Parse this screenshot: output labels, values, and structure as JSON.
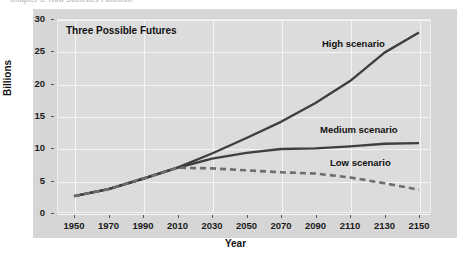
{
  "running_head": "Chapter 3: How Societies Function",
  "chart_data": {
    "type": "line",
    "title": "Three Possible Futures",
    "xlabel": "Year",
    "ylabel": "Billions",
    "xlim": [
      1950,
      2150
    ],
    "ylim": [
      0,
      30
    ],
    "grid": true,
    "legend_position": "inline-annotations",
    "xticks": [
      "1950",
      "1970",
      "1990",
      "2010",
      "2030",
      "2050",
      "2070",
      "2090",
      "2110",
      "2130",
      "2150"
    ],
    "yticks": [
      "0",
      "5",
      "10",
      "15",
      "20",
      "25",
      "30"
    ],
    "x": [
      1950,
      1970,
      1990,
      2010,
      2030,
      2050,
      2070,
      2090,
      2110,
      2130,
      2150
    ],
    "series": [
      {
        "name": "High scenario",
        "style": "solid",
        "color": "#3f3f3f",
        "values": [
          2.6,
          3.7,
          5.3,
          7.0,
          9.2,
          11.6,
          14.1,
          17.0,
          20.4,
          24.8,
          27.9
        ]
      },
      {
        "name": "Medium scenario",
        "style": "solid",
        "color": "#3f3f3f",
        "values": [
          2.6,
          3.7,
          5.3,
          7.0,
          8.4,
          9.3,
          9.9,
          10.0,
          10.3,
          10.7,
          10.8
        ]
      },
      {
        "name": "Low scenario",
        "style": "dashed",
        "color": "#6e6e6e",
        "values": [
          2.6,
          3.7,
          5.3,
          7.0,
          6.9,
          6.6,
          6.3,
          6.1,
          5.5,
          4.6,
          3.6
        ]
      }
    ],
    "annotations": [
      {
        "text": "High scenario",
        "near_x": 2090,
        "near_y": 24.5
      },
      {
        "text": "Medium scenario",
        "near_x": 2085,
        "near_y": 12.6
      },
      {
        "text": "Low scenario",
        "near_x": 2095,
        "near_y": 7.6
      }
    ]
  }
}
